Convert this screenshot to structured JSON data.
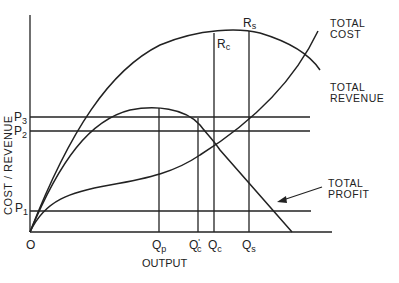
{
  "diagram": {
    "axes": {
      "y_label": "COST / REVENUE",
      "x_label": "OUTPUT",
      "origin": "O"
    },
    "price_levels": [
      {
        "id": "p3",
        "main": "P",
        "sub": "3"
      },
      {
        "id": "p2",
        "main": "P",
        "sub": "2"
      },
      {
        "id": "p1",
        "main": "P",
        "sub": "1"
      }
    ],
    "output_levels": [
      {
        "id": "qp",
        "main": "Q",
        "sub": "p",
        "prime": ""
      },
      {
        "id": "qc_prime",
        "main": "Q",
        "sub": "c",
        "prime": "'"
      },
      {
        "id": "qc",
        "main": "Q",
        "sub": "c",
        "prime": ""
      },
      {
        "id": "qs",
        "main": "Q",
        "sub": "s",
        "prime": ""
      }
    ],
    "points": {
      "rs": {
        "main": "R",
        "sub": "s"
      },
      "rc": {
        "main": "R",
        "sub": "c"
      }
    },
    "curve_labels": {
      "total_cost_1": "TOTAL",
      "total_cost_2": "COST",
      "total_revenue_1": "TOTAL",
      "total_revenue_2": "REVENUE",
      "total_profit_1": "TOTAL",
      "total_profit_2": "PROFIT"
    }
  }
}
